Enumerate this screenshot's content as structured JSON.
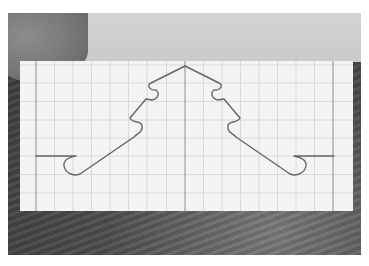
{
  "scene": {
    "description": "Grayscale photo of a strip of graph paper on a dark wooden surface, a grey card and fingertip at the top, with a hand-drawn left-right symmetric hook curve",
    "colors": {
      "background": "#ffffff",
      "wood": "#4a4a4a",
      "card": "#cfcfcf",
      "paper": "#f4f4f2",
      "grid": "#c9c9c9",
      "axis": "#8a8a8a",
      "curve": "#6a6a6a"
    },
    "grid": {
      "cell_px": 18.5,
      "center_axis_x": 185,
      "left_line_x": 36,
      "right_line_x": 333
    },
    "curve": {
      "symmetric": true,
      "apex": [
        185,
        66
      ],
      "left_stub_y": 156,
      "right_stub_y": 156
    }
  }
}
